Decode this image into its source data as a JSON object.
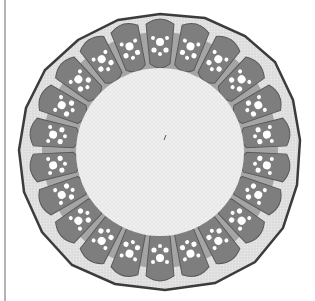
{
  "image": {
    "subject": "plant stem cross-section micrograph",
    "style": "grayscale",
    "colors": {
      "background": "#ffffff",
      "epidermis": "#4a4a4a",
      "cortex": "#d6d6d6",
      "bundle_sheath": "#8a8a8a",
      "vessel": "#ffffff",
      "pith": "#ececec",
      "frame_line": "#b4b4b4"
    },
    "bundle_count": 22
  }
}
